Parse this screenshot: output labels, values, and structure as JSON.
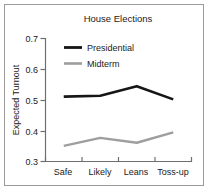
{
  "chart_data": {
    "type": "line",
    "title": "House Elections",
    "xlabel": "",
    "ylabel": "Expected Turnout",
    "categories": [
      "Safe",
      "Likely",
      "Leans",
      "Toss-up"
    ],
    "ylim": [
      0.3,
      0.7
    ],
    "yticks": [
      "0.3",
      "0.4",
      "0.5",
      "0.6",
      "0.7"
    ],
    "ytick_values": [
      0.3,
      0.4,
      0.5,
      0.6,
      0.7
    ],
    "grid": false,
    "legend_position": "top-left inside",
    "series": [
      {
        "name": "Presidential",
        "color": "#161616",
        "values": [
          0.511,
          0.514,
          0.545,
          0.502
        ]
      },
      {
        "name": "Midterm",
        "color": "#9e9e9e",
        "values": [
          0.351,
          0.377,
          0.361,
          0.395
        ]
      }
    ]
  },
  "figure": {
    "frame_color": "#9a9a9a",
    "background": "#ffffff",
    "axis_color": "#6e6e6e"
  }
}
